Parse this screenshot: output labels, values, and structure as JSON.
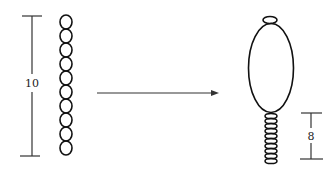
{
  "diagram": {
    "type": "transformation-schematic",
    "colors": {
      "stroke": "#111111",
      "background": "#ffffff",
      "scale": "#333333"
    },
    "left": {
      "scale_label": "10",
      "segments": 10,
      "description": "chain of 10 round segments"
    },
    "arrow": {
      "direction": "right"
    },
    "right": {
      "scale_label": "8",
      "segments": 10,
      "description": "large oval body with small cap on top and chain of compressed segments below"
    }
  }
}
